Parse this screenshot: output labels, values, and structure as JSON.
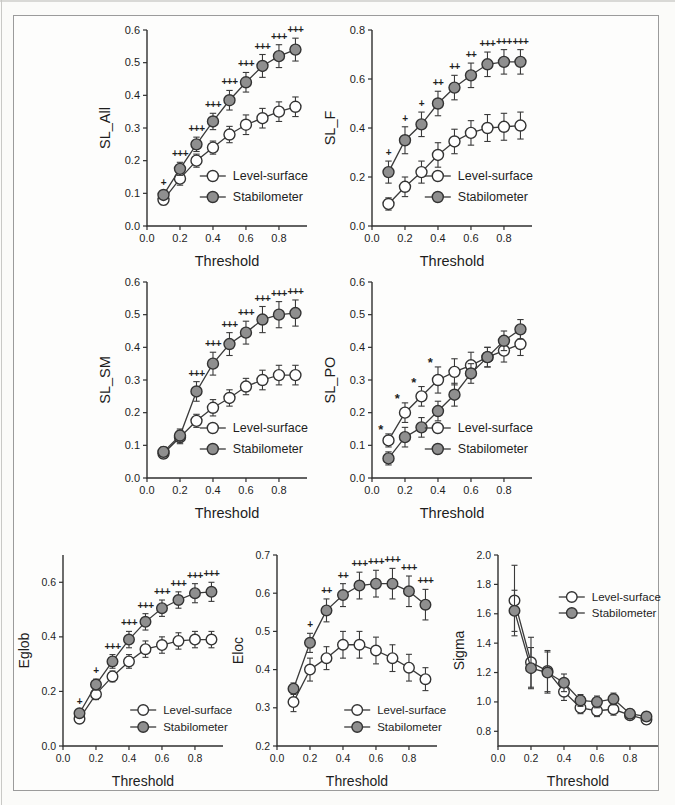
{
  "figure": {
    "xlabel": "Threshold",
    "series_names": [
      "Level-surface",
      "Stabilometer"
    ]
  },
  "colors": {
    "axis": "#2f2f2f",
    "line": "#3a3a3a",
    "text": "#1e1e1e",
    "marker_fill_level_surface": "#ffffff",
    "marker_fill_stabilometer": "#8f8f8f",
    "marker_stroke": "#333333",
    "scan_border": "#9b9b9b",
    "paper": "#fdfdfc"
  },
  "chart_data": [
    {
      "type": "line",
      "id": "sl-all",
      "ylabel": "SL_All",
      "xlabel": "Threshold",
      "x": [
        0.1,
        0.2,
        0.3,
        0.4,
        0.5,
        0.6,
        0.7,
        0.8,
        0.9
      ],
      "xticks": [
        0.0,
        0.2,
        0.4,
        0.6,
        0.8
      ],
      "xlim": [
        0,
        0.97
      ],
      "ylim": [
        0,
        0.6
      ],
      "yticks": [
        0.0,
        0.1,
        0.2,
        0.3,
        0.4,
        0.5,
        0.6
      ],
      "grid": false,
      "series": [
        {
          "name": "Level-surface",
          "marker": "open",
          "values": [
            0.08,
            0.145,
            0.2,
            0.24,
            0.28,
            0.31,
            0.33,
            0.35,
            0.365
          ],
          "errors": [
            0.015,
            0.02,
            0.02,
            0.02,
            0.025,
            0.03,
            0.03,
            0.03,
            0.03
          ]
        },
        {
          "name": "Stabilometer",
          "marker": "filled",
          "values": [
            0.095,
            0.175,
            0.25,
            0.32,
            0.385,
            0.44,
            0.49,
            0.52,
            0.54
          ],
          "errors": [
            0.012,
            0.02,
            0.022,
            0.025,
            0.03,
            0.03,
            0.035,
            0.035,
            0.035
          ]
        }
      ],
      "significance": {
        "symbols": [
          "+",
          "+++",
          "+++",
          "+++",
          "+++",
          "+++",
          "+++",
          "+++",
          "+++"
        ],
        "series_index": 1,
        "dx": 0
      },
      "legend_pos": "lower-right"
    },
    {
      "type": "line",
      "id": "sl-f",
      "ylabel": "SL_F",
      "xlabel": "Threshold",
      "x": [
        0.1,
        0.2,
        0.3,
        0.4,
        0.5,
        0.6,
        0.7,
        0.8,
        0.9
      ],
      "xticks": [
        0.0,
        0.2,
        0.4,
        0.6,
        0.8
      ],
      "xlim": [
        0,
        0.97
      ],
      "ylim": [
        0,
        0.8
      ],
      "yticks": [
        0.0,
        0.2,
        0.4,
        0.6,
        0.8
      ],
      "grid": false,
      "series": [
        {
          "name": "Level-surface",
          "marker": "open",
          "values": [
            0.09,
            0.16,
            0.22,
            0.29,
            0.345,
            0.38,
            0.4,
            0.405,
            0.41
          ],
          "errors": [
            0.025,
            0.04,
            0.045,
            0.05,
            0.05,
            0.05,
            0.055,
            0.055,
            0.055
          ]
        },
        {
          "name": "Stabilometer",
          "marker": "filled",
          "values": [
            0.22,
            0.35,
            0.415,
            0.5,
            0.565,
            0.615,
            0.66,
            0.67,
            0.67
          ],
          "errors": [
            0.045,
            0.055,
            0.05,
            0.05,
            0.05,
            0.05,
            0.05,
            0.05,
            0.05
          ]
        }
      ],
      "significance": {
        "symbols": [
          "+",
          "+",
          "+",
          "++",
          "++",
          "++",
          "+++",
          "+++",
          "+++"
        ],
        "series_index": 1,
        "dx": 0
      },
      "legend_pos": "lower-right"
    },
    {
      "type": "line",
      "id": "sl-sm",
      "ylabel": "SL_SM",
      "xlabel": "Threshold",
      "x": [
        0.1,
        0.2,
        0.3,
        0.4,
        0.5,
        0.6,
        0.7,
        0.8,
        0.9
      ],
      "xticks": [
        0.0,
        0.2,
        0.4,
        0.6,
        0.8
      ],
      "xlim": [
        0,
        0.97
      ],
      "ylim": [
        0,
        0.6
      ],
      "yticks": [
        0.0,
        0.1,
        0.2,
        0.3,
        0.4,
        0.5,
        0.6
      ],
      "grid": false,
      "series": [
        {
          "name": "Level-surface",
          "marker": "open",
          "values": [
            0.075,
            0.125,
            0.175,
            0.215,
            0.245,
            0.28,
            0.3,
            0.315,
            0.315
          ],
          "errors": [
            0.015,
            0.02,
            0.02,
            0.025,
            0.025,
            0.025,
            0.03,
            0.03,
            0.03
          ]
        },
        {
          "name": "Stabilometer",
          "marker": "filled",
          "values": [
            0.08,
            0.13,
            0.265,
            0.35,
            0.41,
            0.445,
            0.485,
            0.5,
            0.505
          ],
          "errors": [
            0.015,
            0.02,
            0.03,
            0.035,
            0.035,
            0.035,
            0.04,
            0.04,
            0.04
          ]
        }
      ],
      "significance": {
        "symbols": [
          "",
          "",
          "+++",
          "+++",
          "+++",
          "+++",
          "+++",
          "+++",
          "+++"
        ],
        "series_index": 1,
        "dx": 0
      },
      "legend_pos": "lower-right"
    },
    {
      "type": "line",
      "id": "sl-po",
      "ylabel": "SL_PO",
      "xlabel": "Threshold",
      "x": [
        0.1,
        0.2,
        0.3,
        0.4,
        0.5,
        0.6,
        0.7,
        0.8,
        0.9
      ],
      "xticks": [
        0.0,
        0.2,
        0.4,
        0.6,
        0.8
      ],
      "xlim": [
        0,
        0.97
      ],
      "ylim": [
        0,
        0.6
      ],
      "yticks": [
        0.0,
        0.1,
        0.2,
        0.3,
        0.4,
        0.5,
        0.6
      ],
      "grid": false,
      "series": [
        {
          "name": "Level-surface",
          "marker": "open",
          "values": [
            0.115,
            0.2,
            0.25,
            0.3,
            0.325,
            0.345,
            0.37,
            0.39,
            0.41
          ],
          "errors": [
            0.02,
            0.03,
            0.03,
            0.04,
            0.04,
            0.04,
            0.03,
            0.035,
            0.035
          ]
        },
        {
          "name": "Stabilometer",
          "marker": "filled",
          "values": [
            0.06,
            0.125,
            0.155,
            0.205,
            0.255,
            0.32,
            0.37,
            0.42,
            0.455
          ],
          "errors": [
            0.02,
            0.03,
            0.03,
            0.03,
            0.035,
            0.03,
            0.03,
            0.03,
            0.03
          ]
        }
      ],
      "significance": {
        "symbols": [
          "*",
          "*",
          "*",
          "*",
          "",
          "",
          "",
          "",
          ""
        ],
        "series_index": 0,
        "dx": -8
      },
      "legend_pos": "lower-right"
    },
    {
      "type": "line",
      "id": "eglob",
      "ylabel": "Eglob",
      "xlabel": "Threshold",
      "x": [
        0.1,
        0.2,
        0.3,
        0.4,
        0.5,
        0.6,
        0.7,
        0.8,
        0.9
      ],
      "xticks": [
        0.0,
        0.2,
        0.4,
        0.6,
        0.8
      ],
      "xlim": [
        0,
        0.97
      ],
      "ylim": [
        0,
        0.7
      ],
      "yticks": [
        0.0,
        0.2,
        0.4,
        0.6
      ],
      "grid": false,
      "series": [
        {
          "name": "Level-surface",
          "marker": "open",
          "values": [
            0.1,
            0.19,
            0.255,
            0.31,
            0.355,
            0.37,
            0.385,
            0.39,
            0.39
          ],
          "errors": [
            0.012,
            0.02,
            0.02,
            0.025,
            0.03,
            0.03,
            0.03,
            0.03,
            0.03
          ]
        },
        {
          "name": "Stabilometer",
          "marker": "filled",
          "values": [
            0.12,
            0.225,
            0.31,
            0.39,
            0.455,
            0.505,
            0.535,
            0.56,
            0.565
          ],
          "errors": [
            0.012,
            0.02,
            0.025,
            0.03,
            0.03,
            0.03,
            0.03,
            0.035,
            0.035
          ]
        }
      ],
      "significance": {
        "symbols": [
          "+",
          "+",
          "+++",
          "+++",
          "+++",
          "+++",
          "+++",
          "+++",
          "+++"
        ],
        "series_index": 1,
        "dx": 0
      },
      "legend_pos": "lower-right"
    },
    {
      "type": "line",
      "id": "eloc",
      "ylabel": "Eloc",
      "xlabel": "Threshold",
      "x": [
        0.1,
        0.2,
        0.3,
        0.4,
        0.5,
        0.6,
        0.7,
        0.8,
        0.9
      ],
      "xticks": [
        0.0,
        0.2,
        0.4,
        0.6,
        0.8
      ],
      "xlim": [
        0,
        0.97
      ],
      "ylim": [
        0.2,
        0.7
      ],
      "yticks": [
        0.2,
        0.3,
        0.4,
        0.5,
        0.6,
        0.7
      ],
      "grid": false,
      "series": [
        {
          "name": "Level-surface",
          "marker": "open",
          "values": [
            0.315,
            0.4,
            0.43,
            0.465,
            0.465,
            0.45,
            0.43,
            0.405,
            0.375
          ],
          "errors": [
            0.025,
            0.03,
            0.03,
            0.035,
            0.035,
            0.035,
            0.035,
            0.035,
            0.03
          ]
        },
        {
          "name": "Stabilometer",
          "marker": "filled",
          "values": [
            0.35,
            0.47,
            0.555,
            0.595,
            0.62,
            0.625,
            0.625,
            0.605,
            0.57
          ],
          "errors": [
            0.015,
            0.025,
            0.03,
            0.03,
            0.035,
            0.035,
            0.04,
            0.04,
            0.04
          ]
        }
      ],
      "significance": {
        "symbols": [
          "",
          "+",
          "++",
          "++",
          "+++",
          "+++",
          "+++",
          "+++",
          "+++"
        ],
        "series_index": 1,
        "dx": 0
      },
      "legend_pos": "lower-right"
    },
    {
      "type": "line",
      "id": "sigma",
      "ylabel": "Sigma",
      "xlabel": "Threshold",
      "x": [
        0.1,
        0.2,
        0.3,
        0.4,
        0.5,
        0.6,
        0.7,
        0.8,
        0.9
      ],
      "xticks": [
        0.0,
        0.2,
        0.4,
        0.6,
        0.8
      ],
      "xlim": [
        0,
        0.97
      ],
      "ylim": [
        0.7,
        2.0
      ],
      "yticks": [
        0.8,
        1.0,
        1.2,
        1.4,
        1.6,
        1.8,
        2.0
      ],
      "grid": false,
      "series": [
        {
          "name": "Level-surface",
          "marker": "open",
          "values": [
            1.69,
            1.27,
            1.21,
            1.07,
            0.96,
            0.94,
            0.95,
            0.91,
            0.88
          ],
          "errors": [
            0.24,
            0.17,
            0.14,
            0.06,
            0.04,
            0.04,
            0.04,
            0.03,
            0.03
          ]
        },
        {
          "name": "Stabilometer",
          "marker": "filled",
          "values": [
            1.62,
            1.23,
            1.2,
            1.13,
            1.01,
            1.0,
            1.02,
            0.92,
            0.9
          ],
          "errors": [
            0.14,
            0.14,
            0.14,
            0.06,
            0.04,
            0.04,
            0.04,
            0.03,
            0.03
          ]
        }
      ],
      "significance": {
        "symbols": [
          "",
          "",
          "",
          "",
          "",
          "",
          "",
          "",
          ""
        ],
        "series_index": 1,
        "dx": 0
      },
      "legend_pos": "upper-right"
    }
  ]
}
